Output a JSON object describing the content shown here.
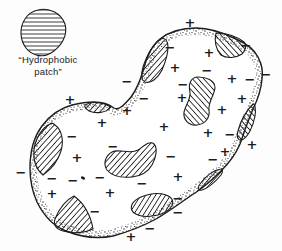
{
  "figure": {
    "background": "#fdfdfd",
    "ink": "#1c1c1c",
    "label": {
      "line1": "“Hydrophobic",
      "line2": "patch”"
    },
    "legend_patch": {
      "name": "hydrophobic-patch-legend",
      "hatch": "horizontal",
      "d": "M38,10 C49,7 61,13 65,24 C68,35 62,46 51,53 C43,58 32,56 26,48 C20,40 19,28 25,19 C28,14 33,11 38,10 Z"
    },
    "protein": {
      "border_texture": "stippled",
      "outline_path": "M94,102 C105,102 110,105 114,108 C119,111 125,104 131,97 C137,89 140,81 143,71 C146,59 150,47 160,39 C170,31 183,28 196,28 C210,28 224,33 236,39 C245,43 254,49 258,57 C262,65 263,70 262,79 C261,91 258,99 253,109 C248,121 244,132 240,144 C235,156 229,163 221,171 C212,180 204,187 195,193 C184,200 170,211 156,219 C143,226 128,232 113,236 C98,239 81,237 66,231 C53,226 43,214 37,202 C32,191 30,180 30,168 C30,153 33,138 42,126 C50,115 61,108 72,105 C80,103 87,102 94,102 Z",
      "patches": [
        {
          "type": "path",
          "hatch": "forward",
          "d": "M161,39 C153,44 147,55 143,67 C141,74 141,80 145,82 C151,84 158,78 162,70 C165,63 168,54 168,47 C168,41 165,37 161,39 Z"
        },
        {
          "type": "path",
          "hatch": "back",
          "d": "M216,33 C225,33 236,36 244,42 C247,45 246,50 242,54 C236,58 227,59 221,55 C216,50 214,41 216,33 Z"
        },
        {
          "type": "path",
          "hatch": "forward",
          "d": "M85,105 C92,101 103,102 111,107 C106,113 96,114 89,111 C86,109 84,107 85,105 Z"
        },
        {
          "type": "path",
          "hatch": "forward",
          "d": "M50,124 C42,128 35,139 34,150 C33,161 37,170 43,175 C50,170 58,161 61,151 C64,141 62,130 55,125 C53,123 51,123 50,124 Z"
        },
        {
          "type": "path",
          "hatch": "back",
          "d": "M198,77 C191,77 188,84 190,92 C191,99 186,104 184,112 C183,120 189,126 197,125 C206,124 210,117 209,110 C208,102 214,96 215,88 C215,80 206,77 198,77 Z"
        },
        {
          "type": "path",
          "hatch": "forward",
          "d": "M112,152 C105,156 103,164 107,170 C112,176 122,178 132,177 C141,176 148,172 152,165 C156,158 158,148 154,144 C150,140 144,146 138,150 C130,155 119,148 112,152 Z"
        },
        {
          "type": "path",
          "hatch": "back",
          "d": "M253,104 C247,110 241,120 238,131 C236,137 238,141 242,140 C248,137 253,127 255,116 C256,110 255,103 253,104 Z"
        },
        {
          "type": "path",
          "hatch": "forward",
          "d": "M221,169 C214,170 206,176 200,184 C197,188 198,191 202,190 C209,188 216,181 221,175 C223,172 223,168 221,169 Z"
        },
        {
          "type": "ellipse",
          "hatch": "forward",
          "cx": 152,
          "cy": 205,
          "rx": 21,
          "ry": 11,
          "rotate": -10
        },
        {
          "type": "path",
          "hatch": "forward",
          "d": "M74,196 C66,200 59,209 55,219 C53,225 56,229 63,231 C73,234 85,233 93,229 C91,216 84,203 74,196 Z"
        }
      ],
      "charges": [
        {
          "sign": "+",
          "x": 70,
          "y": 99,
          "location": "outside"
        },
        {
          "sign": "−",
          "x": 127,
          "y": 81,
          "location": "outside"
        },
        {
          "sign": "+",
          "x": 190,
          "y": 22,
          "location": "outside"
        },
        {
          "sign": "−",
          "x": 266,
          "y": 74,
          "location": "outside"
        },
        {
          "sign": "+",
          "x": 252,
          "y": 144,
          "location": "outside"
        },
        {
          "sign": "−",
          "x": 21,
          "y": 172,
          "location": "outside"
        },
        {
          "sign": "−",
          "x": 150,
          "y": 228,
          "location": "outside"
        },
        {
          "sign": "+",
          "x": 131,
          "y": 236,
          "location": "outside"
        },
        {
          "sign": "−",
          "x": 170,
          "y": 47,
          "location": "inside"
        },
        {
          "sign": "+",
          "x": 209,
          "y": 52,
          "location": "inside"
        },
        {
          "sign": "−",
          "x": 246,
          "y": 45,
          "location": "inside"
        },
        {
          "sign": "+",
          "x": 175,
          "y": 67,
          "location": "inside"
        },
        {
          "sign": "−",
          "x": 207,
          "y": 70,
          "location": "inside"
        },
        {
          "sign": "+",
          "x": 232,
          "y": 78,
          "location": "inside"
        },
        {
          "sign": "−",
          "x": 250,
          "y": 79,
          "location": "inside"
        },
        {
          "sign": "−",
          "x": 183,
          "y": 84,
          "location": "inside"
        },
        {
          "sign": "+",
          "x": 182,
          "y": 97,
          "location": "inside"
        },
        {
          "sign": "−",
          "x": 144,
          "y": 98,
          "location": "inside"
        },
        {
          "sign": "+",
          "x": 242,
          "y": 98,
          "location": "inside"
        },
        {
          "sign": "+",
          "x": 222,
          "y": 109,
          "location": "inside"
        },
        {
          "sign": "+",
          "x": 127,
          "y": 110,
          "location": "inside"
        },
        {
          "sign": "+",
          "x": 102,
          "y": 122,
          "location": "inside"
        },
        {
          "sign": "−",
          "x": 72,
          "y": 136,
          "location": "inside"
        },
        {
          "sign": "+",
          "x": 164,
          "y": 126,
          "location": "inside"
        },
        {
          "sign": "−",
          "x": 113,
          "y": 146,
          "location": "inside"
        },
        {
          "sign": "+",
          "x": 208,
          "y": 132,
          "location": "inside"
        },
        {
          "sign": "−",
          "x": 230,
          "y": 134,
          "location": "inside"
        },
        {
          "sign": "+",
          "x": 77,
          "y": 157,
          "location": "inside"
        },
        {
          "sign": "−",
          "x": 171,
          "y": 156,
          "location": "inside"
        },
        {
          "sign": "+",
          "x": 225,
          "y": 151,
          "location": "inside"
        },
        {
          "sign": "−",
          "x": 213,
          "y": 159,
          "location": "inside"
        },
        {
          "sign": "+",
          "x": 178,
          "y": 176,
          "location": "inside"
        },
        {
          "sign": "−",
          "x": 52,
          "y": 178,
          "location": "inside"
        },
        {
          "sign": "−",
          "x": 73,
          "y": 180,
          "location": "inside"
        },
        {
          "sign": "−",
          "x": 100,
          "y": 177,
          "location": "inside"
        },
        {
          "sign": "+",
          "x": 52,
          "y": 193,
          "location": "inside"
        },
        {
          "sign": "+",
          "x": 110,
          "y": 192,
          "location": "inside"
        },
        {
          "sign": "−",
          "x": 95,
          "y": 211,
          "location": "inside"
        },
        {
          "sign": "−",
          "x": 142,
          "y": 183,
          "location": "inside"
        },
        {
          "sign": "−",
          "x": 178,
          "y": 198,
          "location": "inside"
        },
        {
          "sign": "−",
          "x": 178,
          "y": 212,
          "location": "inside"
        }
      ],
      "speck": {
        "x": 83,
        "y": 178,
        "rx": 2.2,
        "ry": 1.4,
        "rotate": 25
      }
    }
  }
}
